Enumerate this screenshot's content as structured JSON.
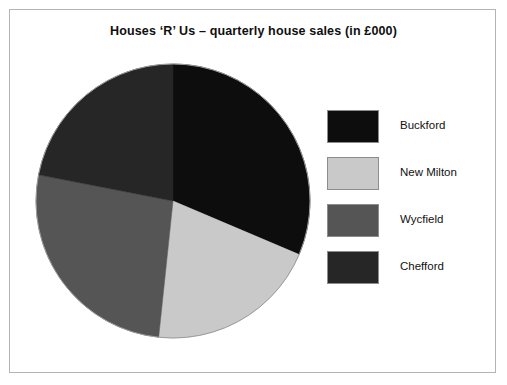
{
  "figure": {
    "title": "Houses ‘R’ Us – quarterly house sales (in £000)",
    "border_color": "#b4b4b4",
    "background": "#ffffff"
  },
  "chart_data": {
    "type": "pie",
    "title": "Houses ‘R’ Us – quarterly house sales (in £000)",
    "xlabel": "",
    "ylabel": "",
    "units": "£000",
    "legend_position": "right",
    "grid": false,
    "start_angle_deg": 0,
    "direction": "clockwise",
    "categories": [
      "Buckford",
      "New Milton",
      "Wycfield",
      "Chefford"
    ],
    "values": [
      31.4,
      20.3,
      26.4,
      21.9
    ],
    "slices": [
      {
        "label": "Buckford",
        "value": 31.4,
        "percent": 31.4,
        "start_angle_deg": 0,
        "end_angle_deg": 113,
        "color": "#0d0d0d"
      },
      {
        "label": "New Milton",
        "value": 20.3,
        "percent": 20.3,
        "start_angle_deg": 113,
        "end_angle_deg": 186,
        "color": "#c9c9c9"
      },
      {
        "label": "Wycfield",
        "value": 26.4,
        "percent": 26.4,
        "start_angle_deg": 186,
        "end_angle_deg": 281,
        "color": "#555555"
      },
      {
        "label": "Chefford",
        "value": 21.9,
        "percent": 21.9,
        "start_angle_deg": 281,
        "end_angle_deg": 360,
        "color": "#262626"
      }
    ],
    "geometry": {
      "center_x": 139,
      "center_y": 139,
      "radius": 137
    }
  },
  "legend": {
    "items": [
      {
        "label": "Buckford",
        "color": "#0d0d0d"
      },
      {
        "label": "New Milton",
        "color": "#c9c9c9"
      },
      {
        "label": "Wycfield",
        "color": "#555555"
      },
      {
        "label": "Chefford",
        "color": "#262626"
      }
    ]
  }
}
